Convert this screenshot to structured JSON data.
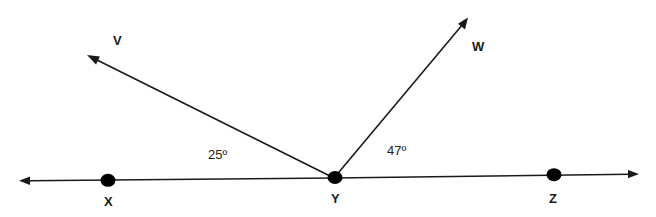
{
  "diagram": {
    "type": "geometry-angles",
    "line": {
      "name": "line XZ",
      "points_on_line": [
        "X",
        "Y",
        "Z"
      ],
      "arrows": "both-ends"
    },
    "rays": [
      {
        "name": "ray YV",
        "from": "Y",
        "through": "V"
      },
      {
        "name": "ray YW",
        "from": "Y",
        "through": "W"
      }
    ],
    "points": {
      "V": {
        "label": "V"
      },
      "W": {
        "label": "W"
      },
      "X": {
        "label": "X"
      },
      "Y": {
        "label": "Y"
      },
      "Z": {
        "label": "Z"
      }
    },
    "angles": [
      {
        "name": "angle XYV",
        "label": "25º",
        "value": 25
      },
      {
        "name": "angle WYZ",
        "label": "47º",
        "value": 47
      }
    ],
    "colors": {
      "stroke": "#1a1a1a",
      "background": "#ffffff"
    }
  }
}
